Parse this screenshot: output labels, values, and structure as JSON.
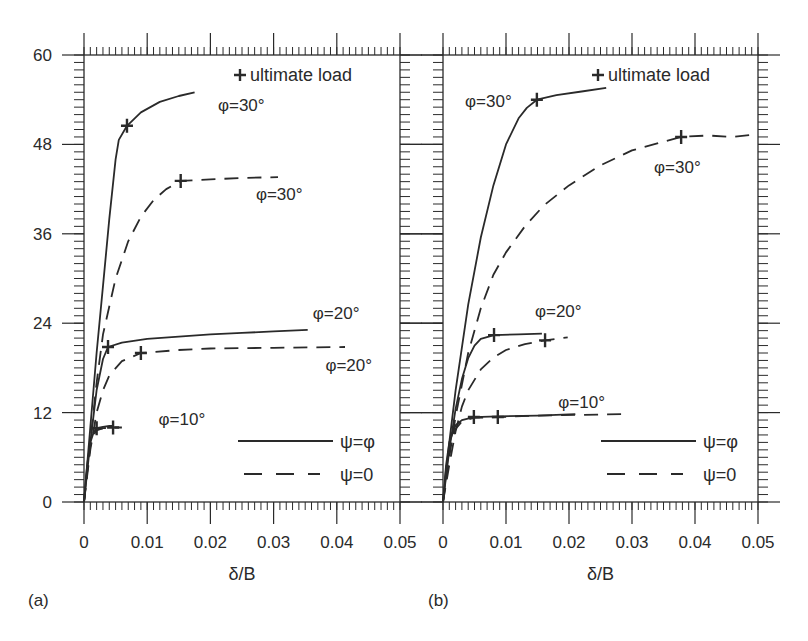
{
  "figure": {
    "panels": [
      "(a)",
      "(b)"
    ],
    "legend_marker_label": "ultimate load",
    "legend_marker_glyph": "+",
    "line_color": "#2a2a2a"
  },
  "chart_data": [
    {
      "type": "line",
      "panel_label": "(a)",
      "title": "",
      "xlabel": "δ/B",
      "ylabel": "",
      "xlim": [
        0,
        0.05
      ],
      "ylim": [
        0,
        60
      ],
      "x_ticks": [
        0,
        0.01,
        0.02,
        0.03,
        0.04,
        0.05
      ],
      "x_tick_labels": [
        "0",
        "0.01",
        "0.02",
        "0.03",
        "0.04",
        "0.05"
      ],
      "y_ticks": [
        0,
        12,
        24,
        36,
        48,
        60
      ],
      "y_tick_labels": [
        "0",
        "12",
        "24",
        "36",
        "48",
        "60"
      ],
      "x_minor_step": 0.001,
      "y_minor_step": 1,
      "grid": false,
      "legend": {
        "position": "lower right",
        "entries": [
          {
            "label": "ψ=φ",
            "style": "solid"
          },
          {
            "label": "ψ=0",
            "style": "dashed"
          }
        ],
        "marker_entry": {
          "glyph": "+",
          "label": "ultimate load",
          "position": "upper right"
        }
      },
      "series": [
        {
          "name": "φ=30°, ψ=φ",
          "style": "solid",
          "x": [
            0,
            0.001,
            0.002,
            0.003,
            0.004,
            0.005,
            0.0055,
            0.0068,
            0.009,
            0.012,
            0.015,
            0.0175
          ],
          "y": [
            0,
            10,
            20,
            29,
            38,
            46,
            48.6,
            50.5,
            52.3,
            53.7,
            54.5,
            55.0
          ],
          "ultimate": [
            0.0068,
            50.5
          ],
          "annotation": {
            "text": "φ=30°",
            "x": 0.0212,
            "y": 52.5
          }
        },
        {
          "name": "φ=30°, ψ=0",
          "style": "dashed",
          "x": [
            0,
            0.001,
            0.002,
            0.003,
            0.005,
            0.007,
            0.009,
            0.011,
            0.013,
            0.0153,
            0.02,
            0.025,
            0.0307
          ],
          "y": [
            0,
            8,
            16,
            22.5,
            30,
            35,
            38.3,
            40.5,
            42.0,
            43.1,
            43.3,
            43.5,
            43.6
          ],
          "ultimate": [
            0.0153,
            43.1
          ],
          "annotation": {
            "text": "φ=30°",
            "x": 0.0272,
            "y": 40.5
          }
        },
        {
          "name": "φ=20°, ψ=φ",
          "style": "solid",
          "x": [
            0,
            0.001,
            0.002,
            0.003,
            0.0038,
            0.006,
            0.01,
            0.015,
            0.02,
            0.025,
            0.03,
            0.0354
          ],
          "y": [
            0,
            8,
            15,
            19.2,
            20.8,
            21.4,
            21.9,
            22.2,
            22.5,
            22.7,
            22.9,
            23.1
          ],
          "ultimate": [
            0.0038,
            20.8
          ],
          "annotation": {
            "text": "φ=20°",
            "x": 0.0362,
            "y": 24.6
          }
        },
        {
          "name": "φ=20°, ψ=0",
          "style": "dashed",
          "x": [
            0,
            0.001,
            0.002,
            0.003,
            0.004,
            0.006,
            0.009,
            0.015,
            0.02,
            0.03,
            0.0413
          ],
          "y": [
            0,
            7,
            12,
            15,
            17,
            18.9,
            20.0,
            20.4,
            20.6,
            20.7,
            20.8
          ],
          "ultimate": [
            0.009,
            20.0
          ],
          "annotation": {
            "text": "φ=20°",
            "x": 0.0382,
            "y": 17.6
          }
        },
        {
          "name": "φ=10°, ψ=φ",
          "style": "solid",
          "x": [
            0,
            0.0005,
            0.001,
            0.0015,
            0.002,
            0.003,
            0.004,
            0.0046
          ],
          "y": [
            0,
            5,
            8,
            9.3,
            9.9,
            10.1,
            10.2,
            10.2
          ],
          "ultimate": [
            0.002,
            9.9
          ],
          "annotation": {
            "text": "φ=10°",
            "x": 0.0118,
            "y": 10.3
          }
        },
        {
          "name": "φ=10°, ψ=0",
          "style": "dashed",
          "x": [
            0,
            0.0005,
            0.001,
            0.0015,
            0.002,
            0.003,
            0.0046,
            0.006
          ],
          "y": [
            0,
            4.5,
            7.5,
            9.0,
            9.6,
            9.9,
            10.0,
            10.0
          ],
          "ultimate": [
            0.0046,
            10.0
          ],
          "annotation": null
        }
      ]
    },
    {
      "type": "line",
      "panel_label": "(b)",
      "title": "",
      "xlabel": "δ/B",
      "ylabel": "",
      "xlim": [
        0,
        0.05
      ],
      "ylim": [
        0,
        60
      ],
      "x_ticks": [
        0,
        0.01,
        0.02,
        0.03,
        0.04,
        0.05
      ],
      "x_tick_labels": [
        "0",
        "0.01",
        "0.02",
        "0.03",
        "0.04",
        "0.05"
      ],
      "y_ticks": [
        0,
        12,
        24,
        36,
        48,
        60
      ],
      "y_tick_labels": [],
      "x_minor_step": 0.001,
      "y_minor_step": 1,
      "grid": false,
      "legend": {
        "position": "lower right",
        "entries": [
          {
            "label": "ψ=φ",
            "style": "solid"
          },
          {
            "label": "ψ=0",
            "style": "dashed"
          }
        ],
        "marker_entry": {
          "glyph": "+",
          "label": "ultimate load",
          "position": "upper right"
        }
      },
      "series": [
        {
          "name": "φ=30°, ψ=φ",
          "style": "solid",
          "x": [
            0,
            0.001,
            0.002,
            0.004,
            0.006,
            0.008,
            0.01,
            0.012,
            0.0133,
            0.0149,
            0.018,
            0.022,
            0.0259
          ],
          "y": [
            0,
            8,
            15,
            26.5,
            35.5,
            42.5,
            48,
            51.5,
            52.9,
            54.0,
            54.6,
            55.1,
            55.6
          ],
          "ultimate": [
            0.0149,
            54.0
          ],
          "annotation": {
            "text": "φ=30°",
            "x": 0.0035,
            "y": 53.0
          }
        },
        {
          "name": "φ=30°, ψ=0",
          "style": "dashed",
          "x": [
            0,
            0.001,
            0.002,
            0.004,
            0.006,
            0.008,
            0.01,
            0.013,
            0.016,
            0.02,
            0.025,
            0.03,
            0.0378,
            0.042,
            0.046,
            0.05
          ],
          "y": [
            0,
            6,
            11.5,
            20,
            26,
            30.5,
            33.5,
            37,
            39.8,
            42.5,
            45.2,
            47.2,
            49.0,
            49.2,
            49.0,
            49.4
          ],
          "ultimate": [
            0.0378,
            49.0
          ],
          "annotation": {
            "text": "φ=30°",
            "x": 0.0335,
            "y": 44.2
          }
        },
        {
          "name": "φ=20°, ψ=φ",
          "style": "solid",
          "x": [
            0,
            0.001,
            0.002,
            0.003,
            0.004,
            0.005,
            0.006,
            0.0081,
            0.012,
            0.0157
          ],
          "y": [
            0,
            7,
            12.5,
            16.5,
            19.3,
            21.0,
            21.9,
            22.4,
            22.5,
            22.6
          ],
          "ultimate": [
            0.0081,
            22.4
          ],
          "annotation": {
            "text": "φ=20°",
            "x": 0.0146,
            "y": 24.8
          }
        },
        {
          "name": "φ=20°, ψ=0",
          "style": "dashed",
          "x": [
            0,
            0.001,
            0.002,
            0.003,
            0.004,
            0.006,
            0.008,
            0.01,
            0.013,
            0.0162,
            0.0198
          ],
          "y": [
            0,
            5,
            9.5,
            12.8,
            15,
            17.8,
            19.4,
            20.4,
            21.2,
            21.7,
            22.1
          ],
          "ultimate": [
            0.0162,
            21.7
          ],
          "annotation": null
        },
        {
          "name": "φ=10°, ψ=φ",
          "style": "solid",
          "x": [
            0,
            0.0005,
            0.001,
            0.002,
            0.003,
            0.0049,
            0.0087,
            0.015,
            0.021
          ],
          "y": [
            0,
            5,
            8,
            10.3,
            11.0,
            11.4,
            11.5,
            11.6,
            11.8
          ],
          "ultimate": [
            0.0049,
            11.4
          ],
          "annotation": {
            "text": "φ=10°",
            "x": 0.0183,
            "y": 12.6
          }
        },
        {
          "name": "φ=10°, ψ=0",
          "style": "dashed",
          "x": [
            0,
            0.0005,
            0.001,
            0.002,
            0.003,
            0.0049,
            0.0087,
            0.015,
            0.0287
          ],
          "y": [
            0,
            4.5,
            7.3,
            9.8,
            10.8,
            11.3,
            11.4,
            11.6,
            11.8
          ],
          "ultimate": [
            0.0087,
            11.4
          ],
          "annotation": null
        }
      ]
    }
  ]
}
